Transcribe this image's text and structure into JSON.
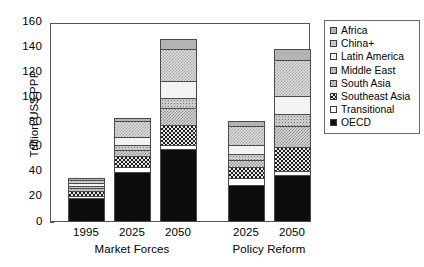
{
  "chart_data": {
    "type": "bar",
    "subtype": "stacked-bar",
    "title": "",
    "xlabel": "",
    "ylabel": "Trillion US$ PPP",
    "ylim": [
      0,
      160
    ],
    "yticks": [
      0,
      20,
      40,
      60,
      80,
      100,
      120,
      140,
      160
    ],
    "ytick_labels": [
      "0",
      "20",
      "40",
      "60",
      "80",
      "100",
      "120",
      "140",
      "160"
    ],
    "grid": false,
    "legend_position": "right-outside",
    "categories": [
      "1995",
      "2025",
      "2050",
      "2025",
      "2050"
    ],
    "groups": [
      {
        "label": "Market Forces",
        "categories": [
          "1995",
          "2025",
          "2050"
        ]
      },
      {
        "label": "Policy Reform",
        "categories": [
          "2025",
          "2050"
        ]
      }
    ],
    "series": [
      {
        "name": "OECD",
        "pattern": "solid-black",
        "values": [
          19,
          40,
          59,
          30,
          38
        ]
      },
      {
        "name": "Transitional",
        "pattern": "white-empty",
        "values": [
          2,
          4,
          3,
          5,
          3
        ]
      },
      {
        "name": "Southeast Asia",
        "pattern": "dense-dark-checker",
        "values": [
          4,
          9,
          16,
          9,
          19
        ]
      },
      {
        "name": "South Asia",
        "pattern": "grey-fine-checker",
        "values": [
          2,
          5,
          14,
          6,
          17
        ]
      },
      {
        "name": "Middle East",
        "pattern": "mid-grey-dot",
        "values": [
          2,
          4,
          8,
          5,
          10
        ]
      },
      {
        "name": "Latin America",
        "pattern": "light-speckle",
        "values": [
          2,
          6,
          13,
          7,
          14
        ]
      },
      {
        "name": "China+",
        "pattern": "light-grey-checker",
        "values": [
          3,
          13,
          26,
          15,
          29
        ]
      },
      {
        "name": "Africa",
        "pattern": "solid-grey",
        "values": [
          1,
          3,
          8,
          4,
          9
        ]
      }
    ],
    "totals": [
      35,
      84,
      146,
      81,
      139
    ]
  },
  "legend": {
    "items": [
      {
        "label": "Africa",
        "fill_class": "fill-africa",
        "name": "africa"
      },
      {
        "label": "China+",
        "fill_class": "fill-china",
        "name": "china-plus"
      },
      {
        "label": "Latin America",
        "fill_class": "fill-latin-america",
        "name": "latin-america"
      },
      {
        "label": "Middle East",
        "fill_class": "fill-middle-east",
        "name": "middle-east"
      },
      {
        "label": "South Asia",
        "fill_class": "fill-south-asia",
        "name": "south-asia"
      },
      {
        "label": "Southeast Asia",
        "fill_class": "fill-southeast-asia",
        "name": "southeast-asia"
      },
      {
        "label": "Transitional",
        "fill_class": "fill-transitional",
        "name": "transitional"
      },
      {
        "label": "OECD",
        "fill_class": "fill-oecd",
        "name": "oecd"
      }
    ]
  },
  "axis": {
    "y_title": "Trillion US$ PPP",
    "zero_label": "0"
  },
  "colors": {
    "axis_line": "#555555",
    "bar_outline": "#4a4a4a",
    "oecd": "#0d0d0d",
    "africa": "#b4b4b4",
    "background": "#ffffff"
  }
}
